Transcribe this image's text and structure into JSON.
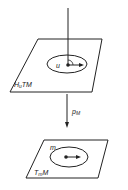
{
  "diagram": {
    "upper_plane": {
      "label": "H",
      "label_sub": "u",
      "label_rest": "TM",
      "point_label": "u"
    },
    "arrow": {
      "label": "p",
      "label_sub": "M"
    },
    "lower_plane": {
      "label": "T",
      "label_sub": "m",
      "label_rest": "M",
      "point_label": "m"
    }
  }
}
